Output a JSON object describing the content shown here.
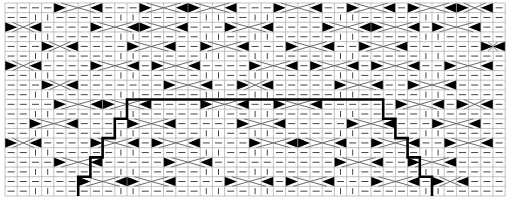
{
  "diagram": {
    "type": "knitting-cable-chart",
    "grid": {
      "cols": 41,
      "rows": 20,
      "x0": 5,
      "y0": 3,
      "cell_w": 12.2,
      "cell_h": 9.65
    },
    "colors": {
      "background": "#ffffff",
      "grid_line": "#9a9a9a",
      "symbol": "#444444",
      "triangle": "#000000",
      "outline": "#000000"
    },
    "legend_symbols": {
      "purl": "horizontal-dash",
      "knit": "vertical-bar",
      "cable": "diagonal-band-with-black-triangles"
    },
    "cables": [
      {
        "row": 0,
        "col": 4,
        "span": 4
      },
      {
        "row": 0,
        "col": 15,
        "span": 4
      },
      {
        "row": 0,
        "col": 22,
        "span": 4
      },
      {
        "row": 0,
        "col": 33,
        "span": 4
      },
      {
        "row": 0,
        "col": 11,
        "span": 4
      },
      {
        "row": 0,
        "col": 28,
        "span": 4
      },
      {
        "row": 0,
        "col": 37,
        "span": 3
      },
      {
        "row": 2,
        "col": 7,
        "span": 4
      },
      {
        "row": 2,
        "col": 11,
        "span": 4
      },
      {
        "row": 2,
        "col": 0,
        "span": 3
      },
      {
        "row": 2,
        "col": 18,
        "span": 4
      },
      {
        "row": 2,
        "col": 26,
        "span": 4
      },
      {
        "row": 2,
        "col": 30,
        "span": 4
      },
      {
        "row": 2,
        "col": 35,
        "span": 4
      },
      {
        "row": 4,
        "col": 10,
        "span": 4
      },
      {
        "row": 4,
        "col": 3,
        "span": 3
      },
      {
        "row": 4,
        "col": 16,
        "span": 4
      },
      {
        "row": 4,
        "col": 29,
        "span": 4
      },
      {
        "row": 4,
        "col": 39,
        "span": 2
      },
      {
        "row": 4,
        "col": 23,
        "span": 4
      },
      {
        "row": 6,
        "col": 7,
        "span": 4
      },
      {
        "row": 6,
        "col": 12,
        "span": 4
      },
      {
        "row": 6,
        "col": 0,
        "span": 3
      },
      {
        "row": 6,
        "col": 20,
        "span": 4
      },
      {
        "row": 6,
        "col": 25,
        "span": 4
      },
      {
        "row": 6,
        "col": 30,
        "span": 4
      },
      {
        "row": 6,
        "col": 36,
        "span": 4
      },
      {
        "row": 8,
        "col": 13,
        "span": 4
      },
      {
        "row": 8,
        "col": 3,
        "span": 3
      },
      {
        "row": 8,
        "col": 27,
        "span": 4
      },
      {
        "row": 8,
        "col": 33,
        "span": 4
      },
      {
        "row": 8,
        "col": 19,
        "span": 3
      },
      {
        "row": 10,
        "col": 4,
        "span": 4
      },
      {
        "row": 10,
        "col": 8,
        "span": 4
      },
      {
        "row": 10,
        "col": 16,
        "span": 4
      },
      {
        "row": 10,
        "col": 22,
        "span": 4
      },
      {
        "row": 10,
        "col": 32,
        "span": 4
      },
      {
        "row": 10,
        "col": 37,
        "span": 3
      },
      {
        "row": 12,
        "col": 10,
        "span": 4
      },
      {
        "row": 12,
        "col": 2,
        "span": 4
      },
      {
        "row": 12,
        "col": 19,
        "span": 4
      },
      {
        "row": 12,
        "col": 28,
        "span": 4
      },
      {
        "row": 12,
        "col": 35,
        "span": 4
      },
      {
        "row": 14,
        "col": 7,
        "span": 4
      },
      {
        "row": 14,
        "col": 12,
        "span": 4
      },
      {
        "row": 14,
        "col": 0,
        "span": 3
      },
      {
        "row": 14,
        "col": 20,
        "span": 4
      },
      {
        "row": 14,
        "col": 24,
        "span": 4
      },
      {
        "row": 14,
        "col": 30,
        "span": 4
      },
      {
        "row": 14,
        "col": 36,
        "span": 4
      },
      {
        "row": 16,
        "col": 4,
        "span": 4
      },
      {
        "row": 16,
        "col": 13,
        "span": 4
      },
      {
        "row": 16,
        "col": 27,
        "span": 4
      },
      {
        "row": 16,
        "col": 33,
        "span": 4
      },
      {
        "row": 18,
        "col": 6,
        "span": 4
      },
      {
        "row": 18,
        "col": 10,
        "span": 4
      },
      {
        "row": 18,
        "col": 18,
        "span": 4
      },
      {
        "row": 18,
        "col": 23,
        "span": 4
      },
      {
        "row": 18,
        "col": 30,
        "span": 4
      },
      {
        "row": 18,
        "col": 35,
        "span": 3
      }
    ],
    "knit_columns": [
      2,
      3,
      9,
      10,
      16,
      17,
      20,
      21,
      27,
      28,
      34,
      35
    ],
    "outline_path": [
      [
        6,
        20
      ],
      [
        6,
        18
      ],
      [
        7,
        18
      ],
      [
        7,
        16
      ],
      [
        8,
        16
      ],
      [
        8,
        14
      ],
      [
        9,
        14
      ],
      [
        9,
        12
      ],
      [
        10,
        12
      ],
      [
        10,
        10
      ],
      [
        31,
        10
      ],
      [
        31,
        12
      ],
      [
        32,
        12
      ],
      [
        32,
        14
      ],
      [
        33,
        14
      ],
      [
        33,
        16
      ],
      [
        34,
        16
      ],
      [
        34,
        18
      ],
      [
        35,
        18
      ],
      [
        35,
        20
      ]
    ]
  }
}
